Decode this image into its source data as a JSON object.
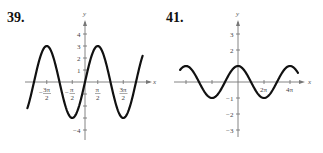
{
  "chart_data": [
    {
      "type": "line",
      "label": "39.",
      "function_hint": "y = 3 sin x",
      "xlabel": "x",
      "ylabel": "y",
      "x_ticks": [
        "-3π/2",
        "-π/2",
        "π/2",
        "3π/2"
      ],
      "x_tick_values": [
        -4.712,
        -1.571,
        1.571,
        4.712
      ],
      "y_ticks": [
        "-4",
        "-3",
        "-2",
        "-1",
        "1",
        "2",
        "3",
        "4"
      ],
      "y_tick_labels_shown": [
        "4",
        "3",
        "2",
        "1",
        "-4"
      ],
      "xlim": [
        -7.1,
        7.1
      ],
      "ylim": [
        -4.5,
        4.5
      ],
      "series": [
        {
          "name": "curve",
          "x": [
            -7.1,
            -4.712,
            -3.1416,
            -1.571,
            0,
            1.571,
            3.1416,
            4.712,
            7.1
          ],
          "y": [
            -2.2,
            3,
            0,
            -3,
            0,
            3,
            0,
            -3,
            2.2
          ]
        }
      ],
      "grid": false
    },
    {
      "type": "line",
      "label": "41.",
      "function_hint": "y = cos(x/2)",
      "xlabel": "x",
      "ylabel": "y",
      "x_ticks": [
        "2π",
        "4π"
      ],
      "x_tick_values": [
        -12.566,
        -6.283,
        6.283,
        12.566
      ],
      "y_ticks": [
        "-3",
        "-2",
        "-1",
        "1",
        "2",
        "3"
      ],
      "y_tick_labels_shown": [
        "3",
        "2",
        "-1",
        "-2",
        "-3"
      ],
      "xlim": [
        -14,
        14.5
      ],
      "ylim": [
        -3.5,
        3.5
      ],
      "series": [
        {
          "name": "curve",
          "x": [
            -14,
            -12.566,
            -6.283,
            0,
            6.283,
            12.566,
            14
          ],
          "y": [
            0.62,
            1,
            -1,
            1,
            -1,
            1,
            0.62
          ]
        }
      ],
      "grid": false
    }
  ],
  "graphs": {
    "g39": {
      "number": "39.",
      "y_axis_label": "y",
      "x_axis_label": "x",
      "y_labels": {
        "p4": "4",
        "p3": "3",
        "p2": "2",
        "p1": "1",
        "m4": "−4"
      },
      "x_labels": {
        "m3pi2_num": "3π",
        "m3pi2_den": "2",
        "mpi2_num": "π",
        "mpi2_den": "2",
        "pi2_num": "π",
        "pi2_den": "2",
        "p3pi2_num": "3π",
        "p3pi2_den": "2",
        "minus": "−"
      }
    },
    "g41": {
      "number": "41.",
      "y_axis_label": "y",
      "x_axis_label": "x",
      "y_labels": {
        "p3": "3",
        "p2": "2",
        "m1": "−1",
        "m2": "−2",
        "m3": "−3"
      },
      "x_labels": {
        "p2pi": "2π",
        "p4pi": "4π"
      }
    }
  }
}
